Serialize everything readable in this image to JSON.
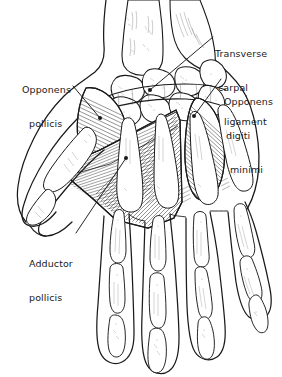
{
  "figure": {
    "name": "palmar-hand-muscles",
    "view": "palmar view of right hand",
    "background_color": "#ffffff",
    "ink_color": "#1a1a1a",
    "width": 282,
    "height": 377
  },
  "labels": [
    {
      "id": "opponens-pollicis",
      "lines": [
        "Opponens",
        "pollicis"
      ],
      "line1": "Opponens",
      "line2": "pollicis",
      "leader": "line from label to thenar eminence muscle"
    },
    {
      "id": "transverse-carpal-ligament",
      "lines": [
        "Transverse",
        "carpal",
        "ligament"
      ],
      "line1": "Transverse",
      "line2": "carpal",
      "line3": "ligament",
      "leader": "line from label to flexor retinaculum across carpal bones"
    },
    {
      "id": "opponens-digiti-minimi",
      "lines": [
        "Opponens",
        "digiti",
        "minimi"
      ],
      "line1": "Opponens",
      "line2": "digiti",
      "line3": "minimi",
      "leader": "line from label to hypothenar eminence muscle"
    },
    {
      "id": "adductor-pollicis",
      "lines": [
        "Adductor",
        "pollicis"
      ],
      "line1": "Adductor",
      "line2": "pollicis",
      "leader": "line from label to fan-shaped central palm muscle"
    }
  ],
  "structures": {
    "bones": [
      "radius",
      "ulna",
      "carpal bones",
      "metacarpals",
      "proximal phalanges",
      "middle phalanges",
      "distal phalanges"
    ],
    "muscles": [
      "opponens pollicis",
      "adductor pollicis",
      "opponens digiti minimi"
    ],
    "ligaments": [
      "transverse carpal ligament"
    ]
  },
  "style": {
    "technique": "pen and ink line drawing with parallel hatching",
    "line_color": "#1a1a1a",
    "muscle_shading": "dense parallel hatch lines"
  }
}
